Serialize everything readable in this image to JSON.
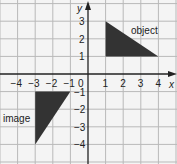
{
  "diagram": {
    "title": "",
    "axes": {
      "x_label": "x",
      "y_label": "y",
      "x_ticks": [
        "-4",
        "-3",
        "-2",
        "-1",
        "0",
        "1",
        "2",
        "3",
        "4"
      ],
      "y_ticks": [
        "3",
        "2",
        "1",
        "-1",
        "-2",
        "-3",
        "-4"
      ],
      "x_range": [
        -5,
        5
      ],
      "y_range": [
        -5,
        4
      ]
    },
    "shapes": [
      {
        "label": "object",
        "vertices": [
          [
            1,
            3
          ],
          [
            1,
            1
          ],
          [
            4,
            1
          ]
        ],
        "fill": "#333333"
      },
      {
        "label": "image",
        "vertices": [
          [
            -3,
            -1
          ],
          [
            -1,
            -1
          ],
          [
            -3,
            -4
          ]
        ],
        "fill": "#333333"
      }
    ],
    "colors": {
      "grid": "#b9b9b9",
      "axis": "#222222",
      "background": "#f4f4f4"
    }
  }
}
